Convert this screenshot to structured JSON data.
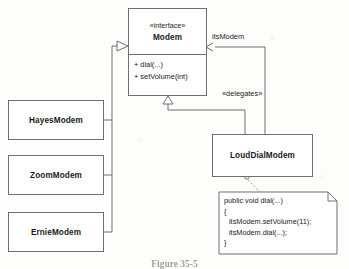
{
  "figure": {
    "caption": "Figure 35-5",
    "kind": "uml-class-diagram"
  },
  "interface": {
    "stereotype": "«interface»",
    "name": "Modem",
    "operations": [
      "+ dial(...)",
      "+ setVolume(int)"
    ]
  },
  "implementors": [
    {
      "name": "HayesModem"
    },
    {
      "name": "ZoomModem"
    },
    {
      "name": "ErnieModem"
    }
  ],
  "delegator": {
    "name": "LoudDialModem"
  },
  "edges": {
    "association_role": "itsModem",
    "delegates_stereotype": "«delegates»"
  },
  "note": {
    "lines": [
      {
        "text": "public void dial(...)",
        "indent": false
      },
      {
        "text": "{",
        "indent": false
      },
      {
        "text": "itsModem.setVolume(11);",
        "indent": true
      },
      {
        "text": "itsModem.dial(...);",
        "indent": true
      },
      {
        "text": "}",
        "indent": false
      }
    ]
  },
  "colors": {
    "stroke": "#6f6f6f",
    "text": "#1a1a1a",
    "paper": "#fdfdfc"
  }
}
